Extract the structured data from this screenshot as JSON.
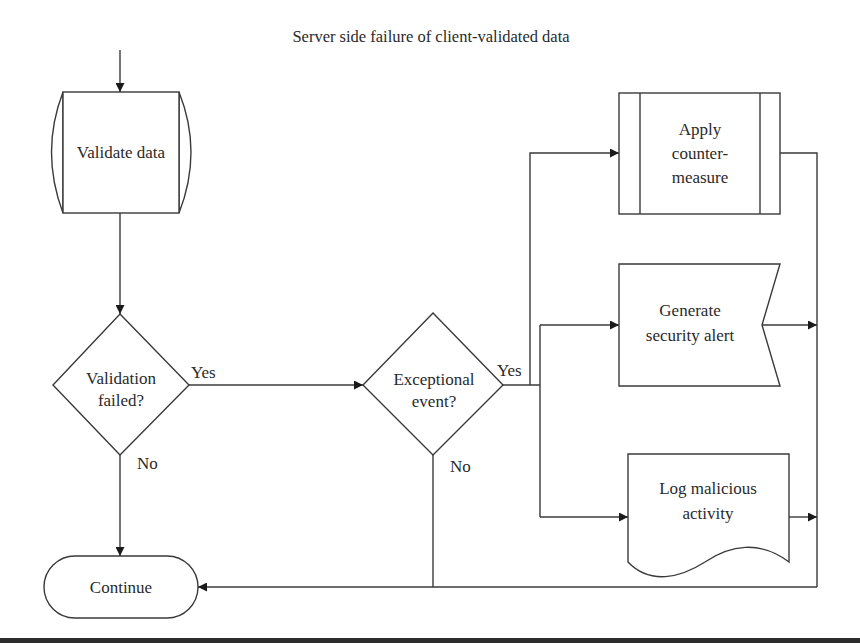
{
  "title": "Server side failure of client-validated data",
  "nodes": {
    "validate_data": {
      "label": "Validate data",
      "shape": "stored-data"
    },
    "validation_failed": {
      "line1": "Validation",
      "line2": "failed?",
      "shape": "decision"
    },
    "exceptional_event": {
      "line1": "Exceptional",
      "line2": "event?",
      "shape": "decision"
    },
    "apply_countermeasure": {
      "line1": "Apply",
      "line2": "counter-",
      "line3": "measure",
      "shape": "predefined-process"
    },
    "generate_alert": {
      "line1": "Generate",
      "line2": "security alert",
      "shape": "display"
    },
    "log_activity": {
      "line1": "Log malicious",
      "line2": "activity",
      "shape": "document"
    },
    "continue": {
      "label": "Continue",
      "shape": "terminator"
    }
  },
  "edges": {
    "validation_yes": "Yes",
    "validation_no": "No",
    "exceptional_yes": "Yes",
    "exceptional_no": "No"
  },
  "colors": {
    "stroke": "#3a3a3a",
    "text": "#2a2a2a",
    "background": "#ffffff"
  }
}
